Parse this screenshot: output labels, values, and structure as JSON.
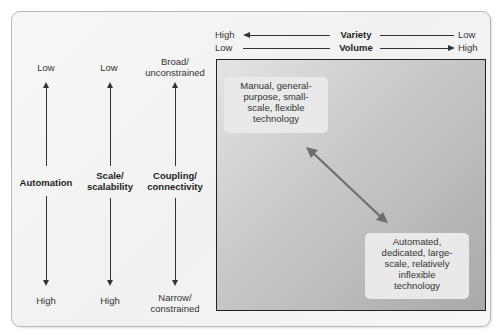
{
  "colors": {
    "frame_border": "#b8b8b8",
    "arrow": "#333333",
    "diagonal_arrow": "#6e6e6e",
    "box_gradient_start": "#e4e4e4",
    "box_gradient_end": "#a9a9a9",
    "note_bg": "#e9e9e9"
  },
  "dimensions": [
    {
      "name": "Automation",
      "top": "Low",
      "bottom": "High"
    },
    {
      "name": "Scale/\nscalability",
      "name_line1": "Scale/",
      "name_line2": "scalability",
      "top": "Low",
      "bottom": "High"
    },
    {
      "name": "Coupling/\nconnectivity",
      "name_line1": "Coupling/",
      "name_line2": "connectivity",
      "top_line1": "Broad/",
      "top_line2": "unconstrained",
      "bottom_line1": "Narrow/",
      "bottom_line2": "constrained"
    }
  ],
  "horizontal_axes": {
    "variety": {
      "label": "Variety",
      "left": "High",
      "right": "Low",
      "arrow_direction": "left"
    },
    "volume": {
      "label": "Volume",
      "left": "Low",
      "right": "High",
      "arrow_direction": "right"
    }
  },
  "matrix": {
    "top_left_note": {
      "lines": [
        "Manual, general-",
        "purpose, small-",
        "scale, flexible",
        "technology"
      ]
    },
    "bottom_right_note": {
      "lines": [
        "Automated,",
        "dedicated, large-",
        "scale, relatively",
        "inflexible",
        "technology"
      ]
    },
    "diagonal_arrow": "bidirectional"
  }
}
